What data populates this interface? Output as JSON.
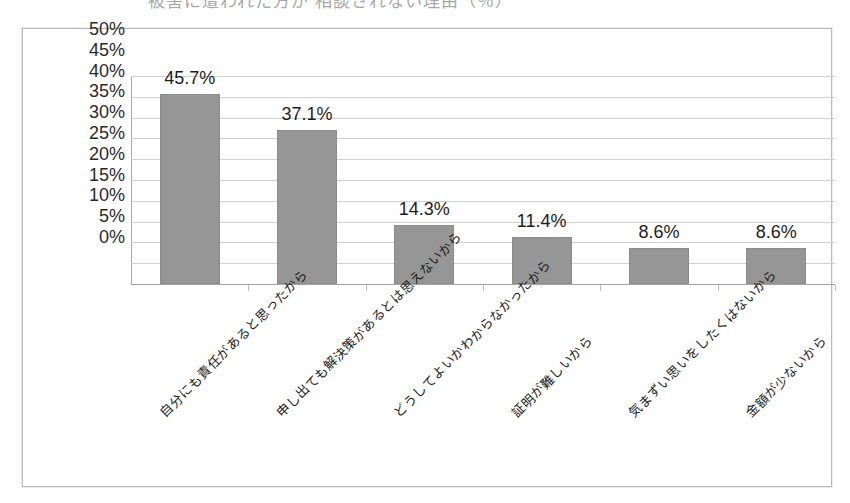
{
  "document": {
    "title_fragment": "被害に遭われた方が 相談されない理由（％）"
  },
  "chart_data": {
    "type": "bar",
    "title": "",
    "xlabel": "",
    "ylabel": "",
    "ylim": [
      0,
      50
    ],
    "grid": true,
    "legend": "none",
    "bar_color": "#969696",
    "categories": [
      "自分にも責任があると思ったから",
      "申し出ても解決策があるとは思えないから",
      "どうしてよいかわからなかったから",
      "証明が難しいから",
      "気まずい思いをしたくはないから",
      "金額が少ないから"
    ],
    "values": [
      45.7,
      37.1,
      14.3,
      11.4,
      8.6,
      8.6
    ],
    "data_labels": [
      "45.7%",
      "37.1%",
      "14.3%",
      "11.4%",
      "8.6%",
      "8.6%"
    ],
    "ytick_values": [
      50,
      45,
      40,
      35,
      30,
      25,
      20,
      15,
      10,
      5,
      0
    ],
    "ytick_labels": [
      "50%",
      "45%",
      "40%",
      "35%",
      "30%",
      "25%",
      "20%",
      "15%",
      "10%",
      "5%",
      "0%"
    ]
  }
}
